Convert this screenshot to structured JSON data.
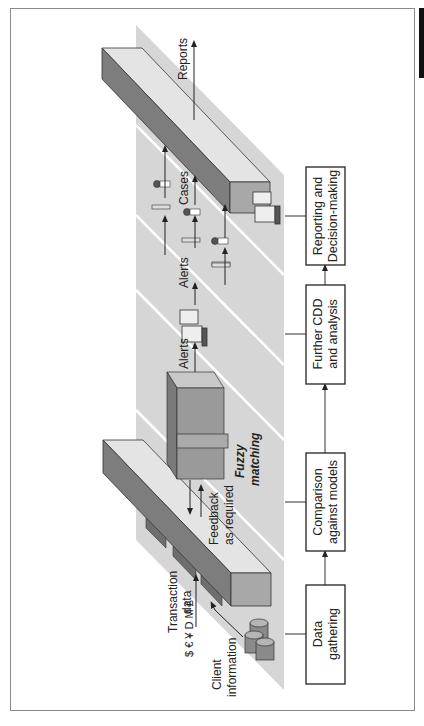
{
  "diagram": {
    "process_steps": [
      {
        "id": "data-gathering",
        "line1": "Data",
        "line2": "gathering"
      },
      {
        "id": "comparison",
        "line1": "Comparison",
        "line2": "against models"
      },
      {
        "id": "further-cdd",
        "line1": "Further CDD",
        "line2": "and analysis"
      },
      {
        "id": "reporting",
        "line1": "Reporting and",
        "line2": "Decision-making"
      }
    ],
    "labels": {
      "transaction_1": "Transaction",
      "transaction_2": "data",
      "currency_symbols": "$ € ¥ D M £",
      "client_1": "Client",
      "client_2": "information",
      "feedback_1": "Feedback",
      "feedback_2": "as required",
      "fuzzy_1": "Fuzzy",
      "fuzzy_2": "matching",
      "alerts_1": "Alerts",
      "alerts_2": "Alerts",
      "cases": "Cases",
      "reports": "Reports"
    },
    "colors": {
      "band": "#d6d6d6",
      "bar_top": "#e4e4e4",
      "bar_side": "#7d7d7d",
      "bar_end": "#a8a8a8",
      "block_front": "#9a9a9a",
      "block_side": "#7a7a7a"
    }
  }
}
